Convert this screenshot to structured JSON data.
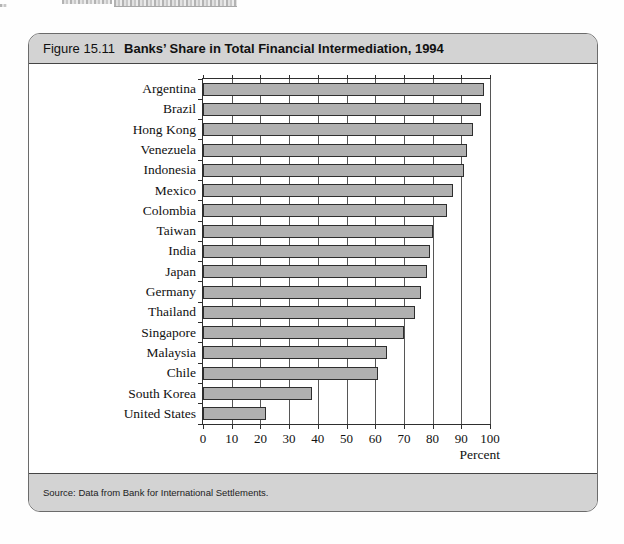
{
  "figure": {
    "label": "Figure 15.11",
    "title": "Banks’ Share in Total Financial Intermediation, 1994",
    "source": "Source: Data from Bank for International Settlements."
  },
  "chart_data": {
    "type": "bar",
    "orientation": "horizontal",
    "title": "Banks’ Share in Total Financial Intermediation, 1994",
    "categories": [
      "Argentina",
      "Brazil",
      "Hong Kong",
      "Venezuela",
      "Indonesia",
      "Mexico",
      "Colombia",
      "Taiwan",
      "India",
      "Japan",
      "Germany",
      "Thailand",
      "Singapore",
      "Malaysia",
      "Chile",
      "South Korea",
      "United States"
    ],
    "values": [
      98,
      97,
      94,
      92,
      91,
      87,
      85,
      80,
      79,
      78,
      76,
      74,
      70,
      64,
      61,
      38,
      22
    ],
    "xlabel": "Percent",
    "xlim": [
      0,
      100
    ],
    "xticks": [
      0,
      10,
      20,
      30,
      40,
      50,
      60,
      70,
      80,
      90,
      100
    ],
    "grid": true,
    "legend": false,
    "bar_color": "#b0b0b0",
    "bar_border_color": "#2e2e2e"
  }
}
